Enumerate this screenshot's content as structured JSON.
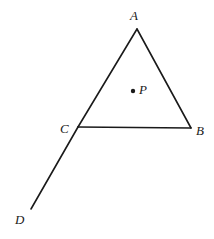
{
  "figure": {
    "type": "geometry-diagram",
    "width": 214,
    "height": 239,
    "background_color": "#ffffff",
    "stroke_color": "#1a1a1a",
    "stroke_width": 1.6,
    "label_color": "#1a1a1a",
    "points": {
      "A": {
        "label": "A",
        "x": 137,
        "y": 29
      },
      "B": {
        "label": "B",
        "x": 191,
        "y": 128
      },
      "C": {
        "label": "C",
        "x": 78,
        "y": 127
      },
      "D": {
        "label": "D",
        "x": 31,
        "y": 209
      },
      "P": {
        "label": "P",
        "x": 133,
        "y": 91
      }
    },
    "label_positions": {
      "A": {
        "x": 130,
        "y": 9
      },
      "B": {
        "x": 196,
        "y": 124
      },
      "C": {
        "x": 60,
        "y": 122
      },
      "D": {
        "x": 15,
        "y": 213
      },
      "P": {
        "x": 139,
        "y": 83
      }
    },
    "segments": [
      {
        "name": "segment-AB",
        "from": "A",
        "to": "B"
      },
      {
        "name": "segment-BC",
        "from": "B",
        "to": "C"
      },
      {
        "name": "segment-CA",
        "from": "C",
        "to": "A"
      },
      {
        "name": "segment-CD",
        "from": "C",
        "to": "D"
      }
    ],
    "marked_point": {
      "name": "point-P",
      "radius": 2.2,
      "fill": "#1a1a1a"
    }
  }
}
